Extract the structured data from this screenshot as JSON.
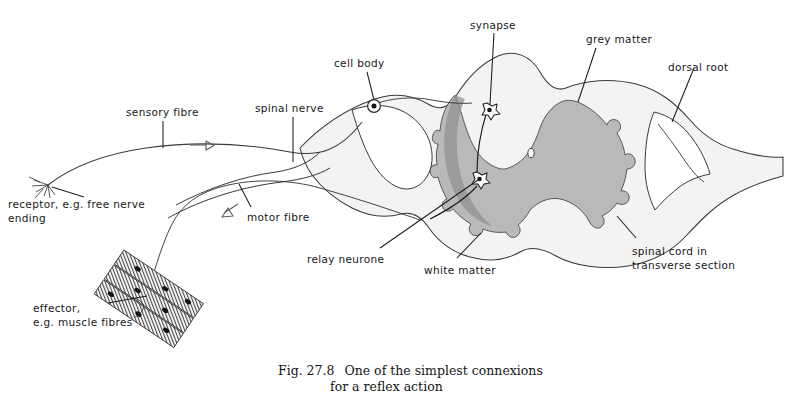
{
  "figure": {
    "caption_number": "Fig. 27.8",
    "caption_line1": "One of the simplest connexions",
    "caption_line2": "for a reflex action",
    "background_color": "#ffffff",
    "ink_color": "#1d1d1d"
  },
  "colors": {
    "grey_matter": "#b9b9b7",
    "grey_matter_dark": "#8f8f8d",
    "white_matter": "#f3f3f1",
    "outline": "#3a3a3a",
    "label_text": "#181818",
    "caption_text": "#141414"
  },
  "labels": {
    "sensory_fibre": "sensory fibre",
    "receptor": "receptor, e.g. free nerve\nending",
    "effector": "effector,\ne.g. muscle fibres",
    "spinal_nerve": "spinal nerve",
    "motor_fibre": "motor fibre",
    "cell_body": "cell body",
    "synapse": "synapse",
    "relay_neurone": "relay neurone",
    "white_matter": "white matter",
    "grey_matter": "grey matter",
    "dorsal_root": "dorsal root",
    "spinal_cord": "spinal cord in\ntransverse section"
  },
  "structures": [
    {
      "name": "spinal-cord-transverse-section",
      "kind": "anatomy"
    },
    {
      "name": "grey-matter-butterfly",
      "kind": "anatomy"
    },
    {
      "name": "white-matter",
      "kind": "anatomy"
    },
    {
      "name": "central-canal",
      "kind": "anatomy"
    },
    {
      "name": "dorsal-root",
      "kind": "anatomy"
    },
    {
      "name": "dorsal-root-ganglion-cell-body",
      "kind": "anatomy"
    },
    {
      "name": "relay-neurone",
      "kind": "anatomy"
    },
    {
      "name": "synapse",
      "kind": "anatomy"
    },
    {
      "name": "sensory-fibre",
      "kind": "pathway"
    },
    {
      "name": "motor-fibre",
      "kind": "pathway"
    },
    {
      "name": "spinal-nerve",
      "kind": "pathway"
    },
    {
      "name": "free-nerve-ending-receptor",
      "kind": "anatomy"
    },
    {
      "name": "muscle-fibres-effector",
      "kind": "anatomy"
    }
  ],
  "flow_arrows": [
    {
      "name": "sensory-direction-arrow",
      "direction": "right"
    },
    {
      "name": "motor-direction-arrow",
      "direction": "down-left"
    }
  ]
}
